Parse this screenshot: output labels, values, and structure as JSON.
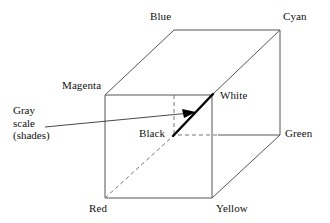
{
  "diagram": {
    "type": "rgb-color-cube",
    "stroke_color": "#555555",
    "accent_color": "#000000",
    "background_color": "#ffffff",
    "vertices": [
      {
        "id": "blue",
        "label": "Blue",
        "x": 174,
        "y": 30,
        "label_x": 150,
        "label_y": 10,
        "hidden": false
      },
      {
        "id": "cyan",
        "label": "Cyan",
        "x": 280,
        "y": 30,
        "label_x": 283,
        "label_y": 10,
        "hidden": false
      },
      {
        "id": "magenta",
        "label": "Magenta",
        "x": 105,
        "y": 95,
        "label_x": 62,
        "label_y": 79,
        "hidden": false
      },
      {
        "id": "white",
        "label": "White",
        "x": 212,
        "y": 95,
        "label_x": 220,
        "label_y": 89,
        "hidden": false
      },
      {
        "id": "black",
        "label": "Black",
        "x": 174,
        "y": 135,
        "label_x": 139,
        "label_y": 127,
        "hidden": true
      },
      {
        "id": "green",
        "label": "Green",
        "x": 280,
        "y": 135,
        "label_x": 285,
        "label_y": 127,
        "hidden": false
      },
      {
        "id": "red",
        "label": "Red",
        "x": 105,
        "y": 198,
        "label_x": 89,
        "label_y": 202,
        "hidden": false
      },
      {
        "id": "yellow",
        "label": "Yellow",
        "x": 212,
        "y": 198,
        "label_x": 216,
        "label_y": 202,
        "hidden": false
      }
    ],
    "callout": {
      "id": "gray-scale",
      "lines": [
        "Gray",
        "scale",
        "(shades)"
      ],
      "label_x": 13,
      "label_y": 104,
      "leader_start_x": 45,
      "leader_start_y": 127,
      "leader_end_x": 196,
      "leader_end_y": 112,
      "arrow": true
    },
    "gray_axis": {
      "from": "black",
      "to": "white",
      "emphasis": "thick"
    }
  }
}
